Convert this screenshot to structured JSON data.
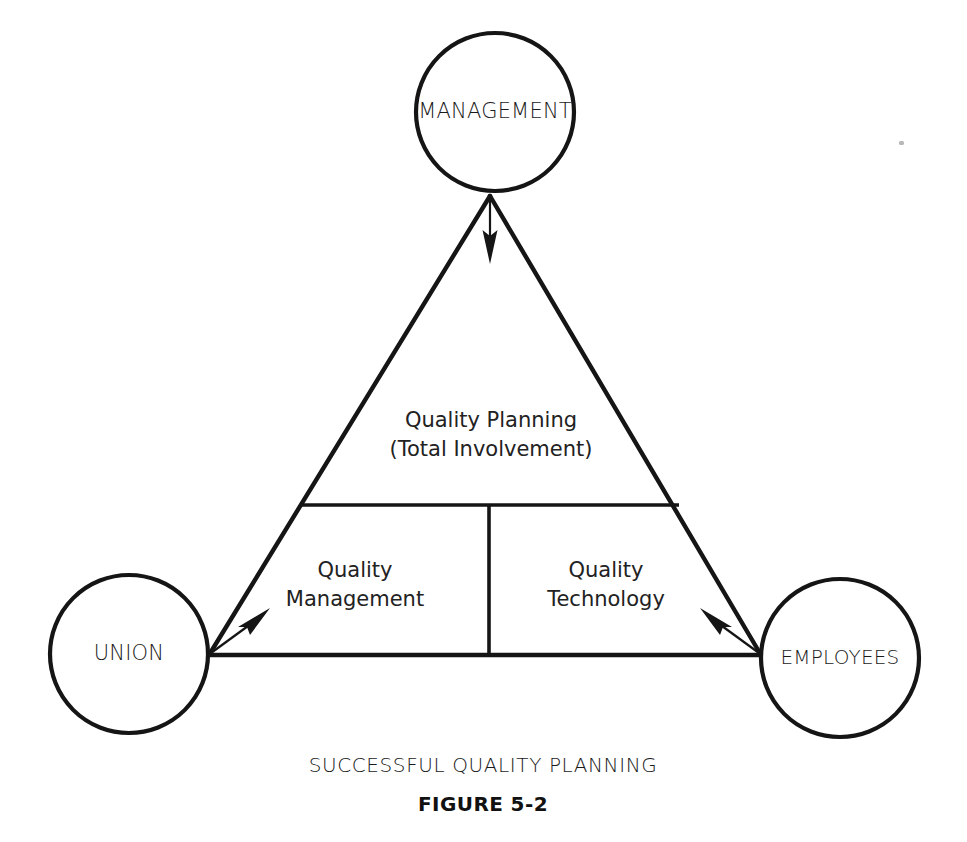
{
  "figure": {
    "caption_main": "SUCCESSFUL QUALITY PLANNING",
    "caption_figure": "FIGURE 5-2",
    "background_color": "#ffffff",
    "ink_color": "#151515"
  },
  "nodes": [
    {
      "id": "management",
      "label": "MANAGEMENT",
      "position": "top",
      "shape": "circle"
    },
    {
      "id": "union",
      "label": "UNION",
      "position": "bottom-left",
      "shape": "circle"
    },
    {
      "id": "employees",
      "label": "EMPLOYEES",
      "position": "bottom-right",
      "shape": "circle"
    }
  ],
  "zones": {
    "top": {
      "line1": "Quality Planning",
      "line2": "(Total Involvement)"
    },
    "bottom_left": {
      "line1": "Quality",
      "line2": "Management"
    },
    "bottom_right": {
      "line1": "Quality",
      "line2": "Technology"
    }
  },
  "arrows": [
    {
      "id": "arrow-from-management",
      "from": "management",
      "direction": "down",
      "points_into": "triangle"
    },
    {
      "id": "arrow-from-union",
      "from": "union",
      "direction": "up-right",
      "points_into": "triangle"
    },
    {
      "id": "arrow-from-employees",
      "from": "employees",
      "direction": "up-left",
      "points_into": "triangle"
    }
  ]
}
